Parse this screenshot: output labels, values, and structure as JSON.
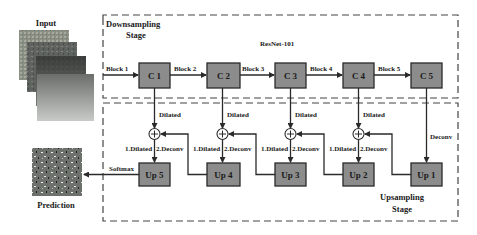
{
  "input": {
    "label": "Input"
  },
  "prediction": {
    "label": "Prediction"
  },
  "downsampling": {
    "title_line1": "Downsampling",
    "title_line2": "Stage",
    "backbone": "ResNet-101"
  },
  "upsampling": {
    "title_line1": "Upsampling",
    "title_line2": "Stage"
  },
  "encoder": {
    "blocks": [
      "Block 1",
      "Block 2",
      "Block 3",
      "Block 4",
      "Block 5"
    ],
    "nodes": [
      "C 1",
      "C 2",
      "C 3",
      "C 4",
      "C 5"
    ]
  },
  "decoder": {
    "nodes": [
      "Up 5",
      "Up 4",
      "Up 3",
      "Up 2",
      "Up 1"
    ],
    "skip_label": "Dilated",
    "merge_label_1": "1.Dilated",
    "merge_label_2": "2.Deconv",
    "deconv_label": "Deconv",
    "softmax_label": "Softmax"
  },
  "colors": {
    "node_fill": "#8c8c8c",
    "line": "#2a2a2a"
  }
}
